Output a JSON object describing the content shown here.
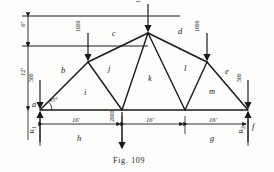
{
  "figure": {
    "caption": "Fig. 109",
    "type": "truss-diagram"
  },
  "geometry": {
    "nodes": {
      "a": {
        "x": 40,
        "y": 110,
        "label": "a"
      },
      "b_top": {
        "x": 88,
        "y": 62
      },
      "apex": {
        "x": 148,
        "y": 33
      },
      "d_top": {
        "x": 207,
        "y": 62
      },
      "f": {
        "x": 248,
        "y": 110,
        "label": "f"
      },
      "bottom_mid": {
        "x": 122,
        "y": 110
      },
      "bottom_right_mid": {
        "x": 185,
        "y": 110
      }
    }
  },
  "members": [
    {
      "name": "b",
      "label": "b",
      "x": 63,
      "y": 72
    },
    {
      "name": "c",
      "label": "c",
      "x": 114,
      "y": 35
    },
    {
      "name": "d",
      "label": "d",
      "x": 180,
      "y": 33
    },
    {
      "name": "e",
      "label": "e",
      "x": 226,
      "y": 73
    },
    {
      "name": "i",
      "label": "i",
      "x": 86,
      "y": 94
    },
    {
      "name": "j",
      "label": "j",
      "x": 110,
      "y": 70
    },
    {
      "name": "k",
      "label": "k",
      "x": 150,
      "y": 80
    },
    {
      "name": "l",
      "label": "l",
      "x": 186,
      "y": 70
    },
    {
      "name": "m",
      "label": "m",
      "x": 211,
      "y": 93
    },
    {
      "name": "h",
      "label": "h",
      "x": 79,
      "y": 140
    },
    {
      "name": "g",
      "label": "g",
      "x": 212,
      "y": 140
    }
  ],
  "loads": [
    {
      "name": "load-apex",
      "value": "1000",
      "x": 148,
      "y": 33
    },
    {
      "name": "load-left",
      "value": "1000",
      "x": 88,
      "y": 62
    },
    {
      "name": "load-right",
      "value": "1000",
      "x": 207,
      "y": 62
    },
    {
      "name": "load-bottom-mid",
      "value": "2000",
      "x": 122,
      "y": 110
    },
    {
      "name": "load-end-left",
      "value": "500",
      "x": 40,
      "y": 110
    },
    {
      "name": "load-end-right",
      "value": "500",
      "x": 248,
      "y": 110
    }
  ],
  "reactions": [
    {
      "name": "reaction-left",
      "label": "R",
      "sub": "1",
      "x": 33,
      "y": 128
    },
    {
      "name": "reaction-right",
      "label": "R",
      "sub": "2",
      "x": 243,
      "y": 128
    }
  ],
  "dimensions": {
    "vertical": [
      {
        "name": "dim-6ft",
        "value": "6'",
        "x": 22,
        "y": 30
      },
      {
        "name": "dim-12ft",
        "value": "12'",
        "x": 22,
        "y": 78
      }
    ],
    "horizontal": [
      {
        "name": "dim-span-1",
        "value": "16'",
        "x": 79,
        "y": 128
      },
      {
        "name": "dim-span-2",
        "value": "16'",
        "x": 153,
        "y": 128
      },
      {
        "name": "dim-span-3",
        "value": "16'",
        "x": 216,
        "y": 128
      }
    ],
    "angle": {
      "name": "angle-45",
      "value": "45°",
      "x": 52,
      "y": 101
    }
  },
  "colors": {
    "line": "#1a1a1a",
    "background": "#fdfdfc"
  }
}
